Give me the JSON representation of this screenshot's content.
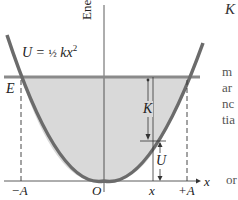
{
  "diagram": {
    "type": "energy-diagram",
    "y_axis_label": "Energy",
    "x_axis_label": "x",
    "curve_label": "U = ½ kx²",
    "curve_label_parts": {
      "lhs": "U = ",
      "frac": "½",
      "rhs": " kx",
      "exp": "2"
    },
    "energy_level_label": "E",
    "kinetic_label": "K",
    "potential_label": "U",
    "tick_labels": {
      "neg_amp": "−A",
      "origin": "O",
      "x": "x",
      "pos_amp": "+A"
    },
    "colors": {
      "curve": "#6b6b6b",
      "energy_line": "#8a8a8a",
      "fill": "#d9d9d9",
      "axis": "#333333",
      "text": "#222222"
    }
  },
  "side_text": {
    "top": "K",
    "lines": [
      "m",
      "ar",
      "nc",
      "tia",
      "or"
    ]
  }
}
